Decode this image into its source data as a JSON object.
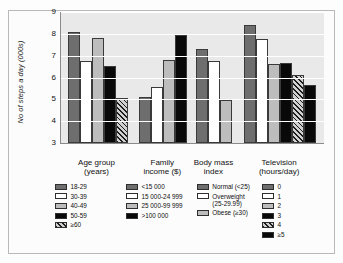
{
  "chart_data": {
    "type": "bar",
    "title": "",
    "subtitle": "",
    "xlabel": "",
    "ylabel": "No of steps a day (000s)",
    "ylim": [
      3,
      9
    ],
    "yticks": [
      9,
      8,
      7,
      6,
      5,
      4,
      3
    ],
    "grid": true,
    "legend_position": "below-axis, one column per category group",
    "categories": [
      "Age group\n(years)",
      "Family\nincome ($)",
      "Body mass\nindex",
      "Television\n(hours/day)"
    ],
    "groups": [
      {
        "name": "Age group (years)",
        "label_line1": "Age group",
        "label_line2": "(years)",
        "bars": [
          {
            "label": "18-29",
            "value": 8.1,
            "fill": "dark"
          },
          {
            "label": "30-39",
            "value": 6.75,
            "fill": "white"
          },
          {
            "label": "40-49",
            "value": 7.8,
            "fill": "gray"
          },
          {
            "label": "50-59",
            "value": 6.55,
            "fill": "black"
          },
          {
            "label": "≥60",
            "value": 5.05,
            "fill": "hatch"
          }
        ]
      },
      {
        "name": "Family income ($)",
        "label_line1": "Family",
        "label_line2": "income ($)",
        "bars": [
          {
            "label": "<15 000",
            "value": 5.1,
            "fill": "dark"
          },
          {
            "label": "15 000-24 999",
            "value": 5.55,
            "fill": "white"
          },
          {
            "label": "25 000-99 999",
            "value": 6.8,
            "fill": "gray"
          },
          {
            "label": ">100 000",
            "value": 7.95,
            "fill": "black"
          }
        ]
      },
      {
        "name": "Body mass index",
        "label_line1": "Body mass",
        "label_line2": "index",
        "bars": [
          {
            "label": "Normal (<25)",
            "value": 7.3,
            "fill": "dark"
          },
          {
            "label": "Overweight\n(25-29.99)",
            "value": 6.75,
            "fill": "white"
          },
          {
            "label": "Obese (≥30)",
            "value": 4.95,
            "fill": "gray"
          }
        ]
      },
      {
        "name": "Television (hours/day)",
        "label_line1": "Television",
        "label_line2": "(hours/day)",
        "bars": [
          {
            "label": "0",
            "value": 8.4,
            "fill": "dark"
          },
          {
            "label": "1",
            "value": 7.75,
            "fill": "white"
          },
          {
            "label": "2",
            "value": 6.6,
            "fill": "gray"
          },
          {
            "label": "3",
            "value": 6.65,
            "fill": "black"
          },
          {
            "label": "4",
            "value": 6.1,
            "fill": "hatch"
          },
          {
            "label": "≥5",
            "value": 5.65,
            "fill": "black"
          }
        ]
      }
    ],
    "colors": {
      "dark": "#6e6e6e",
      "white": "#ffffff",
      "gray": "#bdbdbd",
      "black": "#090909",
      "hatch": "#d0d0d0",
      "plot_background": "#e9e9e9",
      "gridline": "#ffffff",
      "axis": "#8a8a8a"
    }
  }
}
